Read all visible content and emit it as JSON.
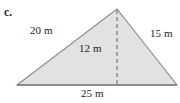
{
  "figure": {
    "part_letter": "c.",
    "shape": "triangle",
    "fill_color": "#e2e2e2",
    "stroke_color": "#8a8a8a",
    "text_color": "#1b1b1b",
    "background_color": "#ffffff",
    "vertices": {
      "apex": [
        117,
        9
      ],
      "bottom_left": [
        17,
        85
      ],
      "bottom_right": [
        177,
        85
      ]
    },
    "height_line": {
      "from": [
        117,
        9
      ],
      "to": [
        117,
        85
      ],
      "style": "dashed"
    },
    "labels": {
      "left_side": "20 m",
      "right_side": "15 m",
      "height": "12 m",
      "base": "25 m"
    }
  }
}
